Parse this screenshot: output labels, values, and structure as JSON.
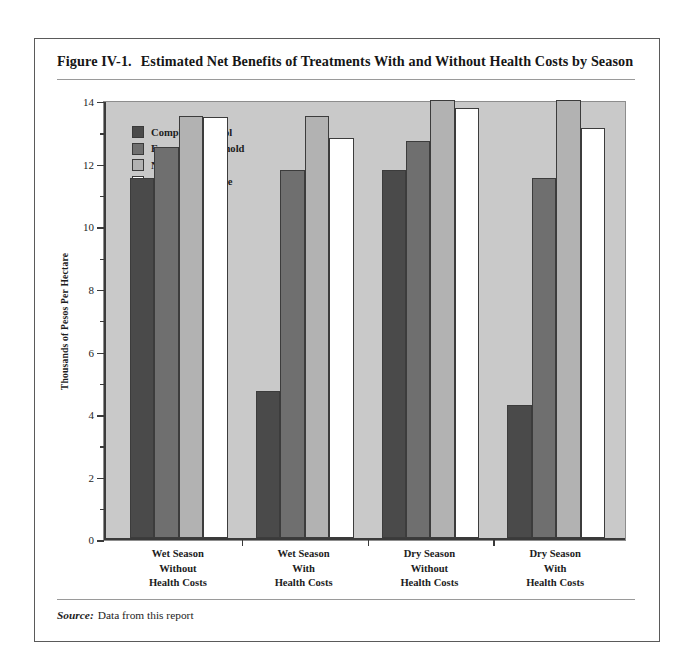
{
  "figure": {
    "number": "Figure IV-1.",
    "title": "Estimated Net Benefits of Treatments With and Without Health Costs by Season",
    "source_label": "Source:",
    "source_text": "Data from this report"
  },
  "colors": {
    "plot_background": "#c9c9c9",
    "page_background": "#ffffff",
    "axis": "#3a3a3a",
    "frame": "#5a5a5a",
    "series_complete_control": "#4a4a4a",
    "series_economic_threshold": "#6f6f6f",
    "series_natural_control": "#b2b2b2",
    "series_farmers_practice": "#ffffff"
  },
  "chart_data": {
    "type": "bar",
    "title": "Estimated Net Benefits of Treatments With and Without Health Costs by Season",
    "xlabel": "",
    "ylabel": "Thousands of Pesos Per Hectare",
    "ylim": [
      0,
      14
    ],
    "ytick_step": 2,
    "yticks": [
      0,
      2,
      4,
      6,
      8,
      10,
      12,
      14
    ],
    "ytick_labels": [
      "0",
      "2",
      "4",
      "6",
      "8",
      "10",
      "12",
      "14"
    ],
    "minor_ticks": [
      1,
      3,
      5,
      7,
      9,
      11,
      13
    ],
    "grid": false,
    "legend_position": "top-left inside plot",
    "categories": [
      "Wet Season Without Health Costs",
      "Wet Season With Health Costs",
      "Dry Season Without Health Costs",
      "Dry Season With Health Costs"
    ],
    "category_lines": [
      [
        "Wet Season",
        "Without",
        "Health Costs"
      ],
      [
        "Wet Season",
        "With",
        "Health Costs"
      ],
      [
        "Dry Season",
        "Without",
        "Health Costs"
      ],
      [
        "Dry Season",
        "With",
        "Health Costs"
      ]
    ],
    "series": [
      {
        "name": "Complete Control",
        "color": "#4a4a4a",
        "values": [
          11.5,
          4.7,
          11.75,
          4.25
        ]
      },
      {
        "name": "Economic Threshold",
        "color": "#6f6f6f",
        "values": [
          12.5,
          11.75,
          12.7,
          11.5
        ]
      },
      {
        "name": "Natural Control",
        "color": "#b2b2b2",
        "values": [
          13.5,
          13.5,
          14.0,
          14.0
        ]
      },
      {
        "name": "Farmers' Practice",
        "color": "#ffffff",
        "values": [
          13.45,
          12.8,
          13.75,
          13.1
        ]
      }
    ]
  }
}
